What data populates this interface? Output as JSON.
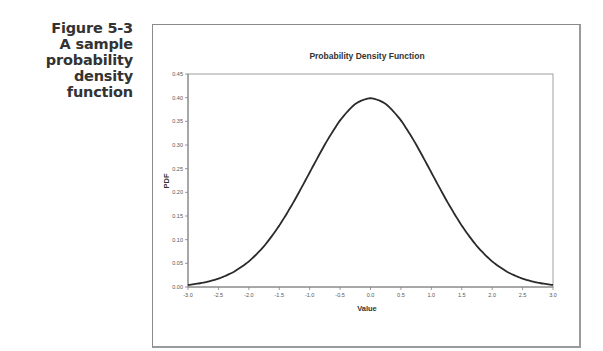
{
  "caption": {
    "lines": [
      "Figure 5-3",
      "A sample",
      "probability",
      "density",
      "function"
    ]
  },
  "chart_data": {
    "type": "line",
    "title": "Probability Density Function",
    "xlabel": "Value",
    "ylabel": "PDF",
    "xlim": [
      -3.0,
      3.0
    ],
    "ylim": [
      0.0,
      0.45
    ],
    "x_ticks": [
      "-3.0",
      "-2.5",
      "-2.0",
      "-1.5",
      "-1.0",
      "-0.5",
      "0.0",
      "0.5",
      "1.0",
      "1.5",
      "2.0",
      "2.5",
      "3.0"
    ],
    "y_ticks": [
      "0.00",
      "0.05",
      "0.10",
      "0.15",
      "0.20",
      "0.25",
      "0.30",
      "0.35",
      "0.40",
      "0.45"
    ],
    "grid": false,
    "legend": null,
    "series": [
      {
        "name": "PDF",
        "x": [
          -3.0,
          -2.75,
          -2.5,
          -2.25,
          -2.0,
          -1.75,
          -1.5,
          -1.25,
          -1.0,
          -0.75,
          -0.5,
          -0.25,
          0.0,
          0.25,
          0.5,
          0.75,
          1.0,
          1.25,
          1.5,
          1.75,
          2.0,
          2.25,
          2.5,
          2.75,
          3.0
        ],
        "values": [
          0.004,
          0.009,
          0.018,
          0.032,
          0.054,
          0.086,
          0.13,
          0.183,
          0.242,
          0.301,
          0.352,
          0.387,
          0.399,
          0.387,
          0.352,
          0.301,
          0.242,
          0.183,
          0.13,
          0.086,
          0.054,
          0.032,
          0.018,
          0.009,
          0.004
        ]
      }
    ]
  }
}
